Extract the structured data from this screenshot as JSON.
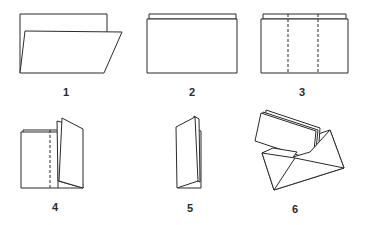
{
  "diagram": {
    "type": "folding-instructions",
    "steps": [
      {
        "number": "1",
        "description": "Sheet folded in half lengthwise, front flap slightly open"
      },
      {
        "number": "2",
        "description": "Folded sheet laid flat with top edge offset"
      },
      {
        "number": "3",
        "description": "Folded sheet with two vertical dashed fold lines"
      },
      {
        "number": "4",
        "description": "Right section folded along dashed line"
      },
      {
        "number": "5",
        "description": "Sheet folded into narrow booklet"
      },
      {
        "number": "6",
        "description": "Folded booklet inserted into an envelope"
      }
    ],
    "colors": {
      "line": "#2a2a2a",
      "background": "#ffffff"
    }
  }
}
